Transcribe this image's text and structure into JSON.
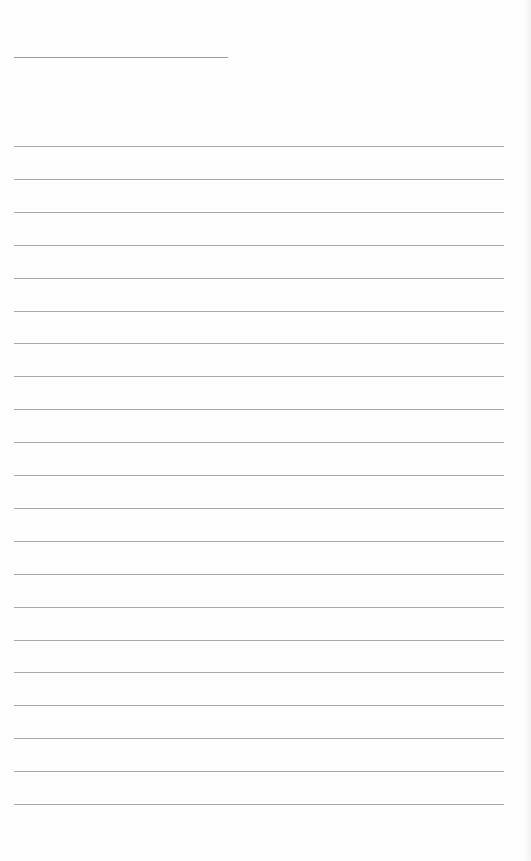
{
  "page": {
    "type": "blank-lined-page",
    "header_line": {
      "x": 14,
      "y": 57,
      "width": 214
    },
    "rules": {
      "count": 21,
      "start_y": 146,
      "spacing": 32.9,
      "x": 14,
      "width": 490
    },
    "colors": {
      "background": "#fefefe",
      "rule": "#a8a8a8"
    }
  }
}
